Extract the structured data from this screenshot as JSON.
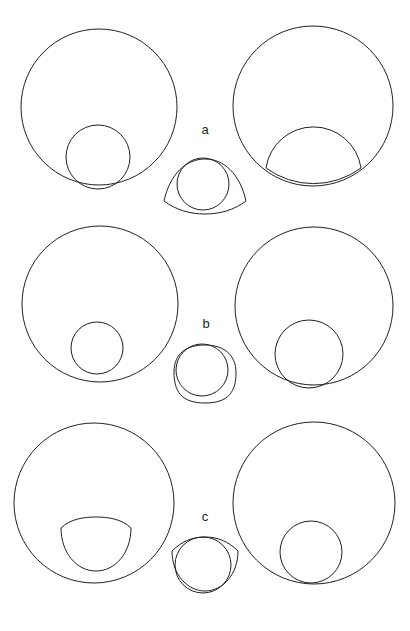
{
  "figure": {
    "caption_labels": [
      "a",
      "b",
      "c"
    ],
    "background_color": "#ffffff",
    "stroke_color": "#231f20",
    "stroke_width": 1,
    "width": 410,
    "height": 631,
    "panel_count": 3,
    "columns_per_panel": 3
  },
  "labels": {
    "row_a": "a",
    "row_b": "b",
    "row_c": "c"
  },
  "chart_data": {
    "type": "diagram",
    "title": "",
    "rows": [
      {
        "label": "a",
        "label_position": {
          "x": 205,
          "y": 131
        },
        "left": {
          "name": "large-circle-with-tangent-small-circle",
          "outer": {
            "shape": "circle",
            "cx": 99,
            "cy": 107,
            "r": 78
          },
          "inner": {
            "shape": "circle",
            "cx": 98,
            "cy": 157,
            "r": 32
          }
        },
        "centre": {
          "name": "circle-in-lens-outline",
          "outer": {
            "shape": "lens",
            "cx": 205,
            "cy": 186,
            "rx": 41,
            "ry": 26
          },
          "inner": {
            "shape": "circle",
            "cx": 203,
            "cy": 184,
            "r": 26
          }
        },
        "right": {
          "name": "large-circle-with-clipped-dome",
          "outer": {
            "shape": "circle",
            "cx": 313,
            "cy": 106,
            "r": 80
          },
          "inner": {
            "shape": "circle",
            "cx": 313,
            "cy": 173,
            "r": 48
          }
        }
      },
      {
        "label": "b",
        "label_position": {
          "x": 206,
          "y": 325
        },
        "left": {
          "name": "large-circle-with-small-inner-circle",
          "outer": {
            "shape": "circle",
            "cx": 100,
            "cy": 304,
            "r": 78
          },
          "inner": {
            "shape": "circle",
            "cx": 97,
            "cy": 348,
            "r": 26
          }
        },
        "centre": {
          "name": "circle-in-squircle-outline",
          "outer": {
            "shape": "squircle",
            "cx": 205,
            "cy": 374,
            "rx": 31,
            "ry": 29
          },
          "inner": {
            "shape": "circle",
            "cx": 202,
            "cy": 370,
            "r": 26
          }
        },
        "right": {
          "name": "large-circle-with-tangent-inner-circle",
          "outer": {
            "shape": "circle",
            "cx": 314,
            "cy": 306,
            "r": 79
          },
          "inner": {
            "shape": "circle",
            "cx": 309,
            "cy": 354,
            "r": 34
          }
        }
      },
      {
        "label": "c",
        "label_position": {
          "x": 205,
          "y": 518
        },
        "left": {
          "name": "large-circle-with-dome-shape",
          "outer": {
            "shape": "circle",
            "cx": 94,
            "cy": 503,
            "r": 80
          },
          "inner": {
            "shape": "dome",
            "cx": 96,
            "cy": 545,
            "rx": 35,
            "ry": 27
          }
        },
        "centre": {
          "name": "circle-in-dome-outline",
          "outer": {
            "shape": "dome-wide",
            "cx": 205,
            "cy": 568,
            "rx": 33,
            "ry": 27
          },
          "inner": {
            "shape": "circle",
            "cx": 203,
            "cy": 565,
            "r": 28
          }
        },
        "right": {
          "name": "large-circle-with-tangent-inner-circle",
          "outer": {
            "shape": "circle",
            "cx": 314,
            "cy": 503,
            "r": 81
          },
          "inner": {
            "shape": "circle",
            "cx": 311,
            "cy": 552,
            "r": 31
          }
        }
      }
    ]
  }
}
